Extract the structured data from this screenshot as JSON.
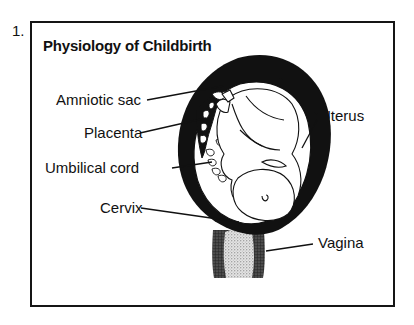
{
  "figure": {
    "number": "1.",
    "title": "Physiology of Childbirth",
    "labels": {
      "amniotic_sac": "Amniotic sac",
      "placenta": "Placenta",
      "umbilical_cord": "Umbilical cord",
      "cervix": "Cervix",
      "uterus": "Uterus",
      "vagina": "Vagina"
    }
  },
  "colors": {
    "ink": "#111111",
    "background": "#ffffff",
    "stipple": "#cfcfcf"
  }
}
